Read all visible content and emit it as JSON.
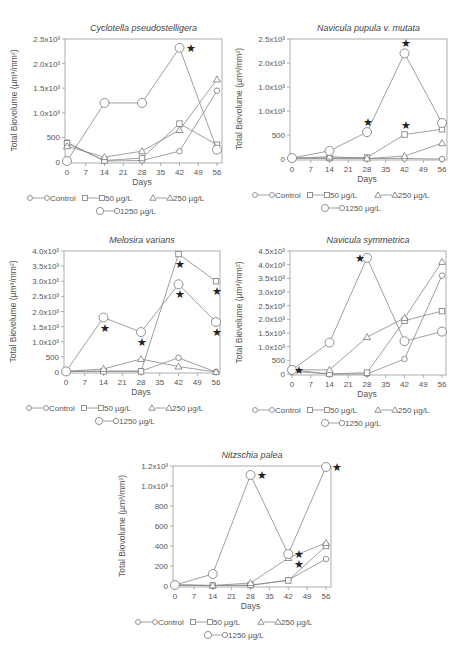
{
  "chart_data": [
    {
      "type": "line",
      "title": "Cyclotella pseudostelligera",
      "xlabel": "Days",
      "ylabel": "Total Biovolume (µm³/mm²)",
      "x": [
        0,
        14,
        28,
        42,
        56
      ],
      "xticks": [
        "0",
        "7",
        "14",
        "21",
        "28",
        "35",
        "42",
        "49",
        "56"
      ],
      "yticks": [
        "0",
        "500",
        "1.0x10³",
        "1.5x10³",
        "2.0x10³",
        "2.5x10³"
      ],
      "ylim": [
        0,
        2500
      ],
      "series": [
        {
          "name": "Control",
          "marker": "circle",
          "values": [
            400,
            20,
            30,
            220,
            1450
          ]
        },
        {
          "name": "50 µg/L",
          "marker": "square",
          "values": [
            380,
            30,
            80,
            780,
            350
          ]
        },
        {
          "name": "250 µg/L",
          "marker": "triangle",
          "values": [
            320,
            100,
            220,
            650,
            1680
          ]
        },
        {
          "name": "1250 µg/L",
          "marker": "diamond",
          "values": [
            20,
            1200,
            1200,
            2320,
            250
          ]
        }
      ],
      "annotations": [
        {
          "series": "1250 µg/L",
          "x": 42,
          "label": "★"
        }
      ],
      "legend_position": "bottom"
    },
    {
      "type": "line",
      "title": "Navicula pupula v. mutata",
      "xlabel": "Days",
      "ylabel": "Total Biovolume (µm³/mm²)",
      "x": [
        0,
        14,
        28,
        42,
        56
      ],
      "xticks": [
        "0",
        "7",
        "14",
        "21",
        "28",
        "35",
        "42",
        "49",
        "56"
      ],
      "yticks": [
        "0",
        "500",
        "1.0x10³",
        "1.0x10³",
        "2.0x10³",
        "2.5x10³"
      ],
      "ylim": [
        0,
        2500
      ],
      "series": [
        {
          "name": "Control",
          "marker": "circle",
          "values": [
            20,
            10,
            10,
            10,
            0
          ]
        },
        {
          "name": "50 µg/L",
          "marker": "square",
          "values": [
            20,
            20,
            30,
            510,
            620
          ]
        },
        {
          "name": "250 µg/L",
          "marker": "triangle",
          "values": [
            10,
            50,
            10,
            60,
            330
          ]
        },
        {
          "name": "1250 µg/L",
          "marker": "diamond",
          "values": [
            20,
            170,
            560,
            2200,
            750
          ]
        }
      ],
      "annotations": [
        {
          "series": "1250 µg/L",
          "x": 28,
          "label": "★"
        },
        {
          "series": "1250 µg/L",
          "x": 42,
          "label": "★"
        },
        {
          "series": "50 µg/L",
          "x": 42,
          "label": "★"
        }
      ],
      "legend_position": "bottom"
    },
    {
      "type": "line",
      "title": "Melosira varians",
      "xlabel": "Days",
      "ylabel": "Total Biovolume (µm³/mm²)",
      "x": [
        0,
        14,
        28,
        42,
        56
      ],
      "xticks": [
        "0",
        "7",
        "14",
        "21",
        "28",
        "35",
        "42",
        "49",
        "56"
      ],
      "yticks": [
        "0",
        "500",
        "1.0x10³",
        "1.5x10³",
        "2.0x10³",
        "2.5x10³",
        "3.0x10³",
        "3.5x10³",
        "4.0x10³"
      ],
      "ylim": [
        0,
        4000
      ],
      "series": [
        {
          "name": "Control",
          "marker": "circle",
          "values": [
            20,
            30,
            30,
            470,
            0
          ]
        },
        {
          "name": "50 µg/L",
          "marker": "square",
          "values": [
            20,
            20,
            20,
            3900,
            3000
          ]
        },
        {
          "name": "250 µg/L",
          "marker": "triangle",
          "values": [
            20,
            100,
            430,
            180,
            0
          ]
        },
        {
          "name": "1250 µg/L",
          "marker": "diamond",
          "values": [
            20,
            1800,
            1320,
            2900,
            1650
          ]
        }
      ],
      "annotations": [
        {
          "series": "1250 µg/L",
          "x": 14,
          "label": "★"
        },
        {
          "series": "1250 µg/L",
          "x": 28,
          "label": "★"
        },
        {
          "series": "1250 µg/L",
          "x": 42,
          "label": "★"
        },
        {
          "series": "50 µg/L",
          "x": 42,
          "label": "★"
        },
        {
          "series": "50 µg/L",
          "x": 56,
          "label": "★"
        },
        {
          "series": "1250 µg/L",
          "x": 56,
          "label": "★"
        }
      ],
      "legend_position": "bottom"
    },
    {
      "type": "line",
      "title": "Navicula symmetrica",
      "xlabel": "Days",
      "ylabel": "Total Biovolume (µm³/mm²)",
      "x": [
        0,
        14,
        28,
        42,
        56
      ],
      "xticks": [
        "0",
        "7",
        "14",
        "21",
        "28",
        "35",
        "42",
        "49",
        "56"
      ],
      "yticks": [
        "0",
        "500",
        "1.0x10³",
        "1.5x10³",
        "2.0x10³",
        "2.5x10³",
        "3.0x10³",
        "3.5x10³",
        "4.0x10³",
        "4.5x10³"
      ],
      "ylim": [
        0,
        4500
      ],
      "series": [
        {
          "name": "Control",
          "marker": "circle",
          "values": [
            100,
            0,
            0,
            550,
            3600
          ]
        },
        {
          "name": "50 µg/L",
          "marker": "square",
          "values": [
            150,
            0,
            50,
            1950,
            2300
          ]
        },
        {
          "name": "250 µg/L",
          "marker": "triangle",
          "values": [
            150,
            150,
            1350,
            2050,
            4100
          ]
        },
        {
          "name": "1250 µg/L",
          "marker": "diamond",
          "values": [
            150,
            1150,
            4250,
            1200,
            1550
          ]
        }
      ],
      "annotations": [
        {
          "series": "1250 µg/L",
          "x": 28,
          "label": "★"
        },
        {
          "series": "50 µg/L",
          "x": 0,
          "label": "★"
        }
      ],
      "legend_position": "bottom"
    },
    {
      "type": "line",
      "title": "Nitzschia palea",
      "xlabel": "Days",
      "ylabel": "Total Biovolume (µm³/mm²)",
      "x": [
        0,
        14,
        28,
        42,
        56
      ],
      "xticks": [
        "0",
        "7",
        "14",
        "21",
        "28",
        "35",
        "42",
        "49",
        "56"
      ],
      "yticks": [
        "0",
        "200",
        "400",
        "600",
        "800",
        "1.0x10³",
        "1.2x10³"
      ],
      "ylim": [
        0,
        1200
      ],
      "series": [
        {
          "name": "Control",
          "marker": "circle",
          "values": [
            10,
            5,
            5,
            60,
            270
          ]
        },
        {
          "name": "50 µg/L",
          "marker": "square",
          "values": [
            10,
            5,
            10,
            55,
            400
          ]
        },
        {
          "name": "250 µg/L",
          "marker": "triangle",
          "values": [
            10,
            5,
            30,
            280,
            430
          ]
        },
        {
          "name": "1250 µg/L",
          "marker": "diamond",
          "values": [
            10,
            120,
            1110,
            320,
            1190
          ]
        }
      ],
      "annotations": [
        {
          "series": "1250 µg/L",
          "x": 28,
          "label": "★"
        },
        {
          "series": "1250 µg/L",
          "x": 42,
          "label": "★"
        },
        {
          "series": "250 µg/L",
          "x": 42,
          "label": "★"
        },
        {
          "series": "1250 µg/L",
          "x": 56,
          "label": "★"
        }
      ],
      "legend_position": "bottom"
    }
  ],
  "legend": {
    "control": "Control",
    "c50": "50 µg/L",
    "c250": "250 µg/L",
    "c1250": "1250 µg/L"
  },
  "axis": {
    "xlabel": "Days",
    "ylabel": "Total Biovolume (µm³/mm²)"
  }
}
